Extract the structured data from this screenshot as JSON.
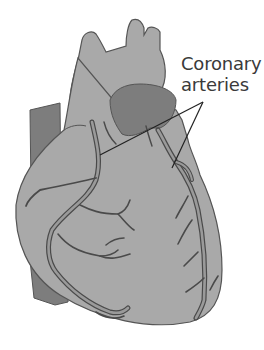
{
  "diagram": {
    "labels": [
      {
        "id": "coronary-arteries",
        "lines": [
          "Coronary",
          "arteries"
        ],
        "pointer_count": 2
      }
    ],
    "colors": {
      "heart_fill": "#a9a9a9",
      "dark_region": "#7d7d7d",
      "outline": "#555555",
      "vessel_fill": "#9a9a9a",
      "vessel_outline": "#4a4a4a",
      "pointer_line": "#222222",
      "label_text": "#3a3a3a",
      "background": "#ffffff"
    }
  }
}
